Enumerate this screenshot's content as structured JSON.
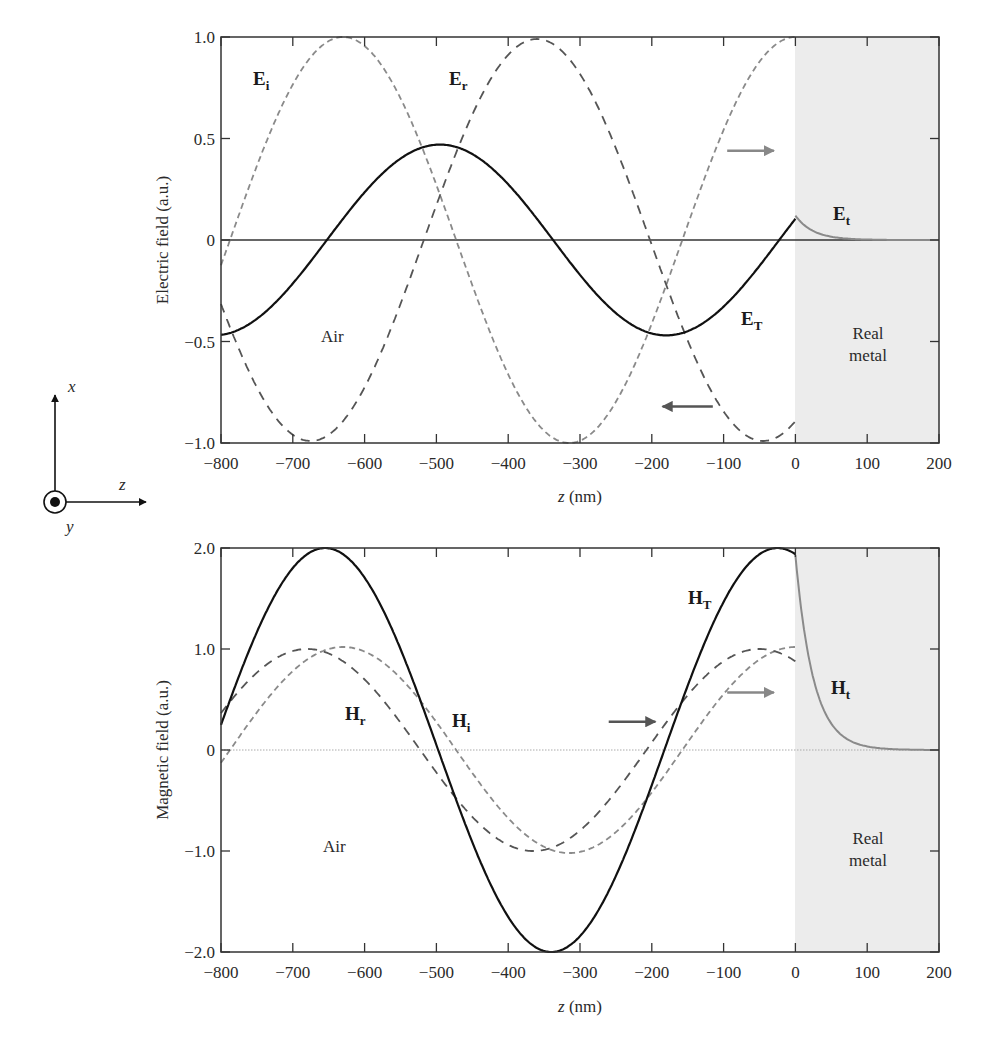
{
  "chart_data": [
    {
      "id": "electric",
      "type": "line",
      "xlabel_var": "z",
      "xlabel_unit": " (nm)",
      "ylabel": "Electric field (a.u.)",
      "xlim": [
        -800,
        200
      ],
      "ylim": [
        -1.0,
        1.0
      ],
      "xticks": [
        -800,
        -700,
        -600,
        -500,
        -400,
        -300,
        -200,
        -100,
        0,
        100,
        200
      ],
      "xtick_labels": [
        "−800",
        "−700",
        "−600",
        "−500",
        "−400",
        "−300",
        "−200",
        "−100",
        "0",
        "100",
        "200"
      ],
      "yticks": [
        1.0,
        0.5,
        0,
        -0.5,
        -1.0
      ],
      "ytick_labels": [
        "1.0",
        "0.5",
        "0",
        "−0.5",
        "−1.0"
      ],
      "zero_line": "solid",
      "regions": [
        {
          "name": "air",
          "label": "Air",
          "x": [
            -800,
            0
          ],
          "fill": "#ffffff"
        },
        {
          "name": "metal",
          "label_lines": [
            "Real",
            "metal"
          ],
          "x": [
            0,
            200
          ],
          "fill": "#ececec"
        }
      ],
      "series": [
        {
          "name": "E_i",
          "label": "E",
          "sub": "i",
          "style": "dashed",
          "color": "#8a8a8a",
          "amplitude": 1.0,
          "wavelength_nm": 630,
          "peak_z": -630,
          "x_range": [
            -800,
            0
          ],
          "sample_points": [
            [
              -800,
              -0.1
            ],
            [
              -630,
              1.0
            ],
            [
              -470,
              0.0
            ],
            [
              -315,
              -1.0
            ],
            [
              -160,
              0.0
            ],
            [
              0,
              1.0
            ]
          ]
        },
        {
          "name": "E_r",
          "label": "E",
          "sub": "r",
          "style": "dashed",
          "color": "#555555",
          "amplitude": 0.99,
          "wavelength_nm": 630,
          "peak_z": -360,
          "x_range": [
            -800,
            0
          ],
          "sample_points": [
            [
              -800,
              -0.4
            ],
            [
              -680,
              -1.0
            ],
            [
              -520,
              0.0
            ],
            [
              -360,
              0.99
            ],
            [
              -200,
              0.0
            ],
            [
              -50,
              -1.0
            ],
            [
              0,
              -0.88
            ]
          ]
        },
        {
          "name": "E_T",
          "label": "E",
          "sub": "T",
          "style": "solid",
          "color": "#111111",
          "amplitude": 0.47,
          "wavelength_nm": 630,
          "peak_z": -495,
          "x_range": [
            -800,
            0
          ],
          "sample_points": [
            [
              -800,
              -0.47
            ],
            [
              -655,
              0.0
            ],
            [
              -495,
              0.47
            ],
            [
              -340,
              0.0
            ],
            [
              -180,
              -0.47
            ],
            [
              0,
              0.12
            ]
          ]
        },
        {
          "name": "E_t",
          "label": "E",
          "sub": "t",
          "style": "solid",
          "color": "#8a8a8a",
          "start_value": 0.12,
          "decay_length_nm": 25,
          "x_range": [
            0,
            200
          ],
          "sample_points": [
            [
              0,
              0.12
            ],
            [
              25,
              0.045
            ],
            [
              50,
              0.015
            ],
            [
              100,
              0.0
            ],
            [
              200,
              0.0
            ]
          ]
        }
      ],
      "annotations": [
        {
          "type": "arrow",
          "direction": "right",
          "z": [
            -95,
            -30
          ],
          "y": 0.44,
          "color": "#888888"
        },
        {
          "type": "arrow",
          "direction": "left",
          "z": [
            -115,
            -185
          ],
          "y": -0.82,
          "color": "#555555"
        }
      ]
    },
    {
      "id": "magnetic",
      "type": "line",
      "xlabel_var": "z",
      "xlabel_unit": " (nm)",
      "ylabel": "Magnetic field (a.u.)",
      "xlim": [
        -800,
        200
      ],
      "ylim": [
        -2.0,
        2.0
      ],
      "xticks": [
        -800,
        -700,
        -600,
        -500,
        -400,
        -300,
        -200,
        -100,
        0,
        100,
        200
      ],
      "xtick_labels": [
        "−800",
        "−700",
        "−600",
        "−500",
        "−400",
        "−300",
        "−200",
        "−100",
        "0",
        "100",
        "200"
      ],
      "yticks": [
        2.0,
        1.0,
        0,
        -1.0,
        -2.0
      ],
      "ytick_labels": [
        "2.0",
        "1.0",
        "0",
        "−1.0",
        "−2.0"
      ],
      "zero_line": "dotted",
      "regions": [
        {
          "name": "air",
          "label": "Air",
          "x": [
            -800,
            0
          ],
          "fill": "#ffffff"
        },
        {
          "name": "metal",
          "label_lines": [
            "Real",
            "metal"
          ],
          "x": [
            0,
            200
          ],
          "fill": "#ececec"
        }
      ],
      "series": [
        {
          "name": "H_i",
          "label": "H",
          "sub": "i",
          "style": "dashed",
          "color": "#8a8a8a",
          "amplitude": 1.02,
          "wavelength_nm": 630,
          "peak_z": -630,
          "x_range": [
            -800,
            0
          ],
          "sample_points": [
            [
              -800,
              -0.05
            ],
            [
              -630,
              1.02
            ],
            [
              -470,
              0.0
            ],
            [
              -315,
              -1.02
            ],
            [
              -160,
              0.0
            ],
            [
              0,
              1.0
            ]
          ]
        },
        {
          "name": "H_r",
          "label": "H",
          "sub": "r",
          "style": "dashed",
          "color": "#555555",
          "amplitude": 1.0,
          "wavelength_nm": 630,
          "peak_z": -680,
          "x_range": [
            -800,
            0
          ],
          "sample_points": [
            [
              -800,
              0.35
            ],
            [
              -680,
              1.02
            ],
            [
              -520,
              0.0
            ],
            [
              -360,
              -1.0
            ],
            [
              -200,
              0.0
            ],
            [
              -50,
              1.0
            ],
            [
              0,
              0.93
            ]
          ]
        },
        {
          "name": "H_T",
          "label": "H",
          "sub": "T",
          "style": "solid",
          "color": "#111111",
          "amplitude": 2.0,
          "wavelength_nm": 630,
          "peak_z": -655,
          "x_range": [
            -800,
            0
          ],
          "sample_points": [
            [
              -800,
              0.27
            ],
            [
              -655,
              2.0
            ],
            [
              -495,
              0.0
            ],
            [
              -335,
              -2.0
            ],
            [
              -178,
              0.0
            ],
            [
              -20,
              2.0
            ],
            [
              0,
              1.93
            ]
          ]
        },
        {
          "name": "H_t",
          "label": "H",
          "sub": "t",
          "style": "solid",
          "color": "#8a8a8a",
          "start_value": 1.93,
          "decay_length_nm": 25,
          "x_range": [
            0,
            200
          ],
          "sample_points": [
            [
              0,
              1.93
            ],
            [
              25,
              0.7
            ],
            [
              50,
              0.26
            ],
            [
              100,
              0.03
            ],
            [
              200,
              0.0
            ]
          ]
        }
      ],
      "annotations": [
        {
          "type": "arrow",
          "direction": "right",
          "z": [
            -95,
            -30
          ],
          "y": 0.57,
          "color": "#888888"
        },
        {
          "type": "arrow",
          "direction": "left",
          "z": [
            -260,
            -195
          ],
          "y": 0.28,
          "color": "#555555"
        }
      ]
    }
  ],
  "labels": {
    "electric": {
      "air": "Air",
      "metal_line1": "Real",
      "metal_line2": "metal",
      "Ei_main": "E",
      "Ei_sub": "i",
      "Er_main": "E",
      "Er_sub": "r",
      "ET_main": "E",
      "ET_sub": "T",
      "Et_main": "E",
      "Et_sub": "t",
      "ylabel": "Electric field (a.u.)",
      "xlabel_var": "z",
      "xlabel_unit": " (nm)"
    },
    "magnetic": {
      "air": "Air",
      "metal_line1": "Real",
      "metal_line2": "metal",
      "Hi_main": "H",
      "Hi_sub": "i",
      "Hr_main": "H",
      "Hr_sub": "r",
      "HT_main": "H",
      "HT_sub": "T",
      "Ht_main": "H",
      "Ht_sub": "t",
      "ylabel": "Magnetic field (a.u.)",
      "xlabel_var": "z",
      "xlabel_unit": " (nm)"
    },
    "coordinate_system": {
      "x_axis": "x",
      "z_axis": "z",
      "y_axis": "y"
    }
  }
}
